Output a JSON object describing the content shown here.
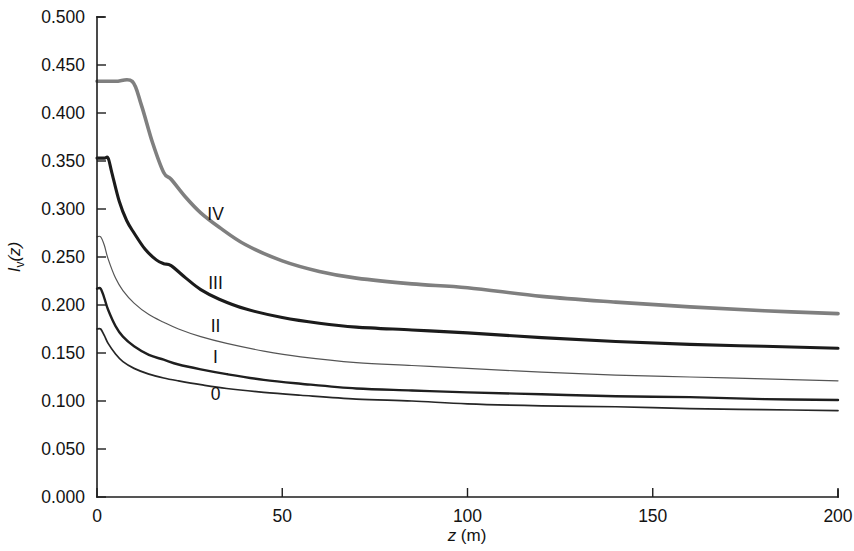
{
  "chart_data": {
    "type": "line",
    "title": "",
    "subtitle": "",
    "xlabel": "z (m)",
    "ylabel": "Iv(z)",
    "xlabel_parts": {
      "italic": "z",
      "rest": " (m)"
    },
    "ylabel_parts": {
      "italic": "I",
      "sub": "v",
      "rest": "(z)"
    },
    "xlim": [
      0,
      200
    ],
    "ylim": [
      0,
      0.5
    ],
    "xticks": [
      0,
      50,
      100,
      150,
      200
    ],
    "xtick_labels": [
      "0",
      "50",
      "100",
      "150",
      "200"
    ],
    "yticks": [
      0.0,
      0.05,
      0.1,
      0.15,
      0.2,
      0.25,
      0.3,
      0.35,
      0.4,
      0.45,
      0.5
    ],
    "ytick_labels": [
      "0.000",
      "0.050",
      "0.100",
      "0.150",
      "0.200",
      "0.250",
      "0.300",
      "0.350",
      "0.400",
      "0.450",
      "0.500"
    ],
    "grid": false,
    "legend": "inline-curve-labels",
    "series": [
      {
        "name": "IV",
        "label": "IV",
        "color": "#7f7f7f",
        "width": 3.6,
        "label_x": 32,
        "label_y": 0.295,
        "x": [
          0,
          5,
          9.5,
          12,
          15,
          18,
          20,
          24,
          28,
          33,
          40,
          50,
          60,
          70,
          85,
          100,
          120,
          140,
          160,
          180,
          200
        ],
        "y": [
          0.433,
          0.433,
          0.433,
          0.408,
          0.369,
          0.338,
          0.331,
          0.312,
          0.296,
          0.281,
          0.263,
          0.246,
          0.235,
          0.228,
          0.222,
          0.218,
          0.209,
          0.203,
          0.198,
          0.194,
          0.191
        ]
      },
      {
        "name": "III",
        "label": "III",
        "color": "#1b1b1b",
        "width": 3.1,
        "label_x": 32,
        "label_y": 0.2225,
        "x": [
          0,
          2,
          3,
          4,
          6,
          8,
          10,
          13,
          16,
          18,
          20,
          24,
          28,
          33,
          40,
          50,
          60,
          70,
          85,
          100,
          120,
          140,
          160,
          180,
          200
        ],
        "y": [
          0.353,
          0.353,
          0.353,
          0.338,
          0.308,
          0.288,
          0.275,
          0.258,
          0.247,
          0.243,
          0.241,
          0.228,
          0.216,
          0.206,
          0.196,
          0.187,
          0.181,
          0.177,
          0.174,
          0.171,
          0.166,
          0.162,
          0.159,
          0.157,
          0.155
        ]
      },
      {
        "name": "II",
        "label": "II",
        "color": "#555555",
        "width": 1.2,
        "label_x": 32,
        "label_y": 0.178,
        "x": [
          0,
          1,
          2,
          3,
          5,
          7,
          10,
          14,
          18,
          22,
          28,
          35,
          45,
          55,
          70,
          85,
          100,
          120,
          140,
          160,
          180,
          200
        ],
        "y": [
          0.271,
          0.271,
          0.262,
          0.248,
          0.228,
          0.215,
          0.202,
          0.19,
          0.182,
          0.175,
          0.167,
          0.16,
          0.152,
          0.146,
          0.14,
          0.137,
          0.134,
          0.13,
          0.127,
          0.125,
          0.123,
          0.121
        ]
      },
      {
        "name": "I",
        "label": "I",
        "color": "#1f1f1f",
        "width": 2.4,
        "label_x": 32,
        "label_y": 0.1455,
        "x": [
          0,
          1,
          2,
          3,
          5,
          7,
          10,
          14,
          18,
          22,
          28,
          35,
          45,
          55,
          70,
          85,
          100,
          120,
          140,
          160,
          180,
          200
        ],
        "y": [
          0.217,
          0.217,
          0.207,
          0.195,
          0.178,
          0.167,
          0.157,
          0.148,
          0.143,
          0.138,
          0.133,
          0.128,
          0.122,
          0.118,
          0.113,
          0.111,
          0.109,
          0.107,
          0.105,
          0.104,
          0.102,
          0.101
        ]
      },
      {
        "name": "0",
        "label": "0",
        "color": "#262626",
        "width": 1.7,
        "label_x": 32,
        "label_y": 0.1075,
        "x": [
          0,
          1,
          2,
          3,
          5,
          7,
          10,
          14,
          18,
          22,
          28,
          35,
          45,
          55,
          70,
          85,
          100,
          120,
          140,
          160,
          180,
          200
        ],
        "y": [
          0.175,
          0.175,
          0.168,
          0.16,
          0.149,
          0.141,
          0.134,
          0.128,
          0.124,
          0.121,
          0.117,
          0.113,
          0.109,
          0.106,
          0.102,
          0.1,
          0.097,
          0.095,
          0.094,
          0.092,
          0.091,
          0.09
        ]
      }
    ]
  }
}
